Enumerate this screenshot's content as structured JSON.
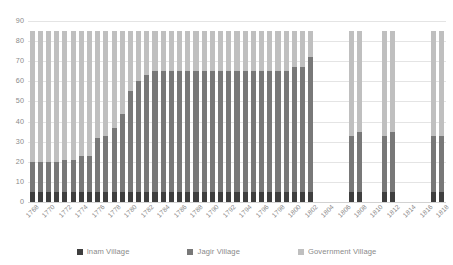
{
  "chart_data": {
    "type": "bar",
    "stacked": true,
    "title": "",
    "subtitle": "",
    "xlabel": "",
    "ylabel": "",
    "ylim": [
      0,
      90
    ],
    "ytick_step": 10,
    "yticks": [
      0,
      10,
      20,
      30,
      40,
      50,
      60,
      70,
      80,
      90
    ],
    "grid": true,
    "legend_position": "bottom",
    "x": [
      1768,
      1769,
      1770,
      1771,
      1772,
      1773,
      1774,
      1775,
      1776,
      1777,
      1778,
      1779,
      1780,
      1781,
      1782,
      1783,
      1784,
      1785,
      1786,
      1787,
      1788,
      1789,
      1790,
      1791,
      1792,
      1793,
      1794,
      1795,
      1796,
      1797,
      1798,
      1799,
      1800,
      1801,
      1802,
      1803,
      1804,
      1805,
      1806,
      1807,
      1808,
      1809,
      1810,
      1811,
      1812,
      1813,
      1814,
      1815,
      1816,
      1817,
      1818
    ],
    "tick_labels": [
      "1768",
      "1770",
      "1772",
      "1774",
      "1776",
      "1778",
      "1780",
      "1782",
      "1784",
      "1786",
      "1788",
      "1790",
      "1792",
      "1794",
      "1796",
      "1798",
      "1800",
      "1802",
      "1804",
      "1806",
      "1808",
      "1810",
      "1812",
      "1814",
      "1816",
      "1818"
    ],
    "categories": [
      "1768",
      "1769",
      "1770",
      "1771",
      "1772",
      "1773",
      "1774",
      "1775",
      "1776",
      "1777",
      "1778",
      "1779",
      "1780",
      "1781",
      "1782",
      "1783",
      "1784",
      "1785",
      "1786",
      "1787",
      "1788",
      "1789",
      "1790",
      "1791",
      "1792",
      "1793",
      "1794",
      "1795",
      "1796",
      "1797",
      "1798",
      "1799",
      "1800",
      "1801",
      "1802",
      "1803",
      "1804",
      "1805",
      "1806",
      "1807",
      "1808",
      "1809",
      "1810",
      "1811",
      "1812",
      "1813",
      "1814",
      "1815",
      "1816",
      "1817",
      "1818"
    ],
    "series": [
      {
        "name": "Inam Village",
        "color": "#3f3f3f",
        "values": [
          5,
          5,
          5,
          5,
          5,
          5,
          5,
          5,
          5,
          5,
          5,
          5,
          5,
          5,
          5,
          5,
          5,
          5,
          5,
          5,
          5,
          5,
          5,
          5,
          5,
          5,
          5,
          5,
          5,
          5,
          5,
          5,
          5,
          5,
          5,
          0,
          0,
          0,
          0,
          5,
          5,
          0,
          0,
          5,
          5,
          0,
          0,
          0,
          0,
          5,
          5
        ]
      },
      {
        "name": "Jagir Village",
        "color": "#787878",
        "values": [
          15,
          15,
          15,
          15,
          16,
          16,
          18,
          18,
          27,
          28,
          32,
          39,
          50,
          55,
          58,
          60,
          60,
          60,
          60,
          60,
          60,
          60,
          60,
          60,
          60,
          60,
          60,
          60,
          60,
          60,
          60,
          60,
          62,
          62,
          67,
          0,
          0,
          0,
          0,
          28,
          30,
          0,
          0,
          28,
          30,
          0,
          0,
          0,
          0,
          28,
          28
        ]
      },
      {
        "name": "Government Village",
        "color": "#bfbfbf",
        "values": [
          65,
          65,
          65,
          65,
          64,
          64,
          62,
          62,
          53,
          52,
          48,
          41,
          30,
          25,
          22,
          20,
          20,
          20,
          20,
          20,
          20,
          20,
          20,
          20,
          20,
          20,
          20,
          20,
          20,
          20,
          20,
          20,
          18,
          18,
          13,
          0,
          0,
          0,
          0,
          52,
          50,
          0,
          0,
          52,
          50,
          0,
          0,
          0,
          0,
          52,
          52
        ]
      }
    ]
  },
  "legend": {
    "items": [
      {
        "label": "Inam Village",
        "color": "#3f3f3f"
      },
      {
        "label": "Jagir Village",
        "color": "#787878"
      },
      {
        "label": "Government Village",
        "color": "#bfbfbf"
      }
    ]
  },
  "colors": {
    "inam": "#3f3f3f",
    "jagir": "#787878",
    "government": "#bfbfbf",
    "gridline": "#e4e4e4",
    "tick_text": "#8a8a8a",
    "background": "#ffffff"
  }
}
